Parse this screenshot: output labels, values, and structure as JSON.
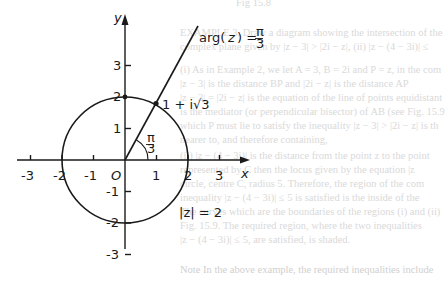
{
  "figure": {
    "type": "complex-plane diagram",
    "axes": {
      "x_label": "x",
      "y_label": "y",
      "origin_label": "O",
      "x_ticks": [
        "-3",
        "-2",
        "-1",
        "1",
        "2",
        "3"
      ],
      "y_ticks": [
        "3",
        "2",
        "1",
        "-1",
        "-2",
        "-3"
      ]
    },
    "circle_label": "|z| = 2",
    "ray_label_prefix": "arg(",
    "ray_label_var": "z",
    "ray_label_suffix": ") =",
    "ray_label_frac_num": "π",
    "ray_label_frac_den": "3",
    "angle_label_num": "π",
    "angle_label_den": "3",
    "point_label": "1 + i√3",
    "colors": {
      "ink": "#1a1a1a",
      "bleed_text": "#d9d9d9",
      "background": "#ffffff"
    }
  },
  "bleed_through_text": [
    "Fig 15.8",
    "EXAMPLE 3.  Draw a diagram showing the intersection of the",
    "complex plane given by |z − 3| > |2i − z|,  (ii) |z − (4 − 3i)| ≤",
    "(i)  As in Example 2, we let A = 3, B = 2i and P = z, in the com",
    "|z − 3| is the distance BP and |2i − z| is the distance AP",
    "|z − 3| = |2i − z| is the equation of the line of points equidistant",
    "is the mediator (or perpendicular bisector) of AB (see Fig. 15.9",
    "which P must lie to satisfy the inequality |z − 3| > |2i − z| is th",
    "nearer to, and therefore containing,",
    "(ii) |z − (4 − 3i)| is the distance from the point z to the point",
    "represented by C then the locus given by the equation |z",
    "circle, centre C, radius 5. Therefore, the region of the com",
    "inequality |z − (4 − 3i)| ≤ 5 is satisfied is the inside of the",
    "The curves which are the boundaries of the regions (i) and (ii)",
    "Fig. 15.9. The required region, where the two inequalities",
    "|z − (4 − 3i)| ≤ 5, are satisfied, is shaded.",
    "Note  In the above example, the required inequalities include"
  ]
}
